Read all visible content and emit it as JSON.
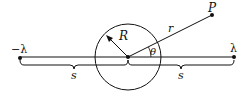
{
  "diagram": {
    "labels": {
      "neg_lambda": "−λ",
      "pos_lambda": "λ",
      "radius": "R",
      "distance": "r",
      "point": "P",
      "angle": "θ",
      "left_half": "s",
      "right_half": "s"
    },
    "geometry": {
      "circle_center": [
        128,
        57
      ],
      "circle_radius": 33,
      "line_left_end": [
        20,
        57
      ],
      "line_right_end": [
        234,
        57
      ],
      "point_P": [
        212,
        15
      ]
    },
    "colors": {
      "ink": "#111111",
      "background": "#ffffff"
    }
  }
}
